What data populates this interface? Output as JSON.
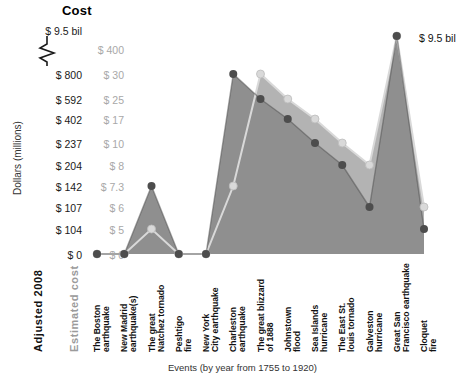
{
  "title": "Cost",
  "axis": {
    "y_label": "Dollars (millions)",
    "x_label": "Events (by year from 1755 to 1920)",
    "col_header_adjusted": "Adjusted 2008",
    "col_header_estimated": "Estimated cost",
    "top_label": "$ 9.5 bil",
    "break_icon": "axis-break-zigzag"
  },
  "annotation": {
    "peak_label": "$ 9.5 bil"
  },
  "colors": {
    "adjusted_fill": "#b3b3b3",
    "estimated_fill": "#8f8f8f",
    "adjusted_marker": "#d9d9d9",
    "estimated_marker": "#4d4d4d",
    "adjusted_tick_text": "#1a1a1a",
    "estimated_tick_text": "#a8a8a8"
  },
  "chart_data": {
    "type": "area",
    "title": "Cost",
    "xlabel": "Events (by year from 1755 to 1920)",
    "ylabel": "Dollars (millions)",
    "grid": false,
    "legend_position": "y-axis-dual-ticks",
    "axis_break": true,
    "categories": [
      "The Boston earthquake",
      "New Madrid earthquake(s)",
      "The great Natchez tornado",
      "Peshtigo fire",
      "New York City earthquake",
      "Charleston earthquake",
      "The great blizzard of 1888",
      "Johnstown flood",
      "Sea Islands hurricane",
      "The East St. louis tornado",
      "Galveston hurricane",
      "Great San Francisco earthquake",
      "Cloquet fire"
    ],
    "y_ticks_adjusted": [
      "$ 9.5 bil",
      "$ 800",
      "$ 592",
      "$ 402",
      "$ 237",
      "$ 204",
      "$ 142",
      "$ 107",
      "$ 104",
      "$ 0"
    ],
    "y_ticks_estimated": [
      "$ 400",
      "$ 30",
      "$ 25",
      "$ 17",
      "$ 10",
      "$ 8",
      "$ 7.3",
      "$ 6",
      "$ 5",
      "$ 0"
    ],
    "series": [
      {
        "name": "Adjusted 2008",
        "unit": "$ millions",
        "values": [
          0,
          0,
          104,
          0,
          0,
          142,
          800,
          592,
          402,
          237,
          204,
          9500,
          107
        ]
      },
      {
        "name": "Estimated cost",
        "unit": "$ millions",
        "values": [
          0,
          0,
          7.3,
          0,
          0,
          30,
          25,
          17,
          10,
          8,
          6,
          400,
          5
        ]
      }
    ]
  }
}
